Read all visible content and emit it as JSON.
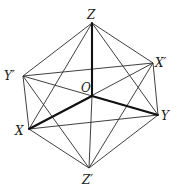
{
  "diagram": {
    "title": "",
    "vertices": {
      "Z": {
        "label": "Z",
        "x": 92,
        "y": 23
      },
      "Zp": {
        "label": "Z′",
        "x": 89,
        "y": 168
      },
      "X": {
        "label": "X",
        "x": 29,
        "y": 129
      },
      "Xp": {
        "label": "X′",
        "x": 153,
        "y": 63
      },
      "Y": {
        "label": "Y",
        "x": 158,
        "y": 115
      },
      "Yp": {
        "label": "Y′",
        "x": 23,
        "y": 76
      },
      "O": {
        "label": "O",
        "x": 92,
        "y": 96
      }
    },
    "labels": {
      "Z": "Z",
      "Zp": "Z′",
      "X": "X",
      "Xp": "X′",
      "Y": "Y",
      "Yp": "Y′",
      "O": "O"
    },
    "axes_bold": [
      [
        "O",
        "Z"
      ],
      [
        "O",
        "X"
      ],
      [
        "O",
        "Y"
      ]
    ],
    "edges_thin": [
      [
        "Z",
        "Yp"
      ],
      [
        "Z",
        "Xp"
      ],
      [
        "Z",
        "X"
      ],
      [
        "Z",
        "Y"
      ],
      [
        "Zp",
        "Yp"
      ],
      [
        "Zp",
        "Xp"
      ],
      [
        "Zp",
        "X"
      ],
      [
        "Zp",
        "Y"
      ],
      [
        "Yp",
        "Xp"
      ],
      [
        "Xp",
        "Y"
      ],
      [
        "Y",
        "X"
      ],
      [
        "X",
        "Yp"
      ],
      [
        "Yp",
        "Y"
      ],
      [
        "X",
        "Xp"
      ],
      [
        "O",
        "Zp"
      ]
    ],
    "colors": {
      "line": "#2a2a2a",
      "axis": "#111111",
      "background": "#ffffff"
    }
  }
}
